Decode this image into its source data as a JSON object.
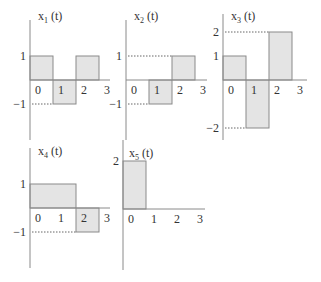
{
  "chart_data": [
    {
      "type": "step",
      "name": "x1",
      "title": "x",
      "subscript": "1",
      "title_suffix": " (t)",
      "segments": [
        {
          "t0": 0,
          "t1": 1,
          "value": 1
        },
        {
          "t0": 1,
          "t1": 2,
          "value": -1
        },
        {
          "t0": 2,
          "t1": 3,
          "value": 1
        }
      ],
      "x_ticks": [
        "0",
        "1",
        "2",
        "3"
      ],
      "y_ticks": [
        {
          "value": 1,
          "label": "1",
          "dotted": false
        },
        {
          "value": -1,
          "label": "−1",
          "dotted": true
        }
      ],
      "xlim": [
        0,
        3
      ],
      "ylim": [
        -2.5,
        2.5
      ]
    },
    {
      "type": "step",
      "name": "x2",
      "title": "x",
      "subscript": "2",
      "title_suffix": " (t)",
      "segments": [
        {
          "t0": 1,
          "t1": 2,
          "value": -1
        },
        {
          "t0": 2,
          "t1": 3,
          "value": 1
        }
      ],
      "x_ticks": [
        "0",
        "1",
        "2",
        "3"
      ],
      "y_ticks": [
        {
          "value": 1,
          "label": "1",
          "dotted": true
        },
        {
          "value": -1,
          "label": "−1",
          "dotted": true
        }
      ],
      "xlim": [
        0,
        3
      ],
      "ylim": [
        -2.5,
        2.5
      ]
    },
    {
      "type": "step",
      "name": "x3",
      "title": "x",
      "subscript": "3",
      "title_suffix": " (t)",
      "segments": [
        {
          "t0": 0,
          "t1": 1,
          "value": 1
        },
        {
          "t0": 1,
          "t1": 2,
          "value": -2
        },
        {
          "t0": 2,
          "t1": 3,
          "value": 2
        }
      ],
      "x_ticks": [
        "0",
        "1",
        "2",
        "3"
      ],
      "y_ticks": [
        {
          "value": 2,
          "label": "2",
          "dotted": true
        },
        {
          "value": 1,
          "label": "1",
          "dotted": false
        },
        {
          "value": -2,
          "label": "−2",
          "dotted": true
        }
      ],
      "xlim": [
        0,
        3
      ],
      "ylim": [
        -2.5,
        2.5
      ]
    },
    {
      "type": "step",
      "name": "x4",
      "title": "x",
      "subscript": "4",
      "title_suffix": " (t)",
      "segments": [
        {
          "t0": 0,
          "t1": 2,
          "value": 1
        },
        {
          "t0": 2,
          "t1": 3,
          "value": -1
        }
      ],
      "x_ticks": [
        "0",
        "1",
        "2",
        "3"
      ],
      "y_ticks": [
        {
          "value": 1,
          "label": "1",
          "dotted": false
        },
        {
          "value": -1,
          "label": "−1",
          "dotted": true
        }
      ],
      "xlim": [
        0,
        3
      ],
      "ylim": [
        -2.5,
        2.5
      ]
    },
    {
      "type": "step",
      "name": "x5",
      "title": "x",
      "subscript": "5",
      "title_suffix": " (t)",
      "segments": [
        {
          "t0": 0,
          "t1": 1,
          "value": 2
        }
      ],
      "x_ticks": [
        "0",
        "1",
        "2",
        "3"
      ],
      "y_ticks": [
        {
          "value": 2,
          "label": "2",
          "dotted": false
        }
      ],
      "xlim": [
        0,
        3
      ],
      "ylim": [
        -2.5,
        2.5
      ]
    }
  ]
}
